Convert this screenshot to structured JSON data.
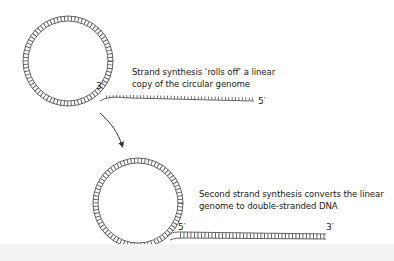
{
  "diagram": {
    "stage1": {
      "caption_lines": [
        "Strand synthesis ‘rolls off’ a linear",
        "copy of the circular genome"
      ],
      "label_circle_end": "3′",
      "label_strand_end": "5′"
    },
    "stage2": {
      "caption_lines": [
        "Second strand synthesis converts the linear",
        "genome to double-stranded DNA"
      ],
      "label_circle_end": "5′",
      "label_strand_end": "3′"
    },
    "colors": {
      "strand": "#555555",
      "arrow": "#333333",
      "text": "#1a1a1a",
      "footer": "#f3f3f3"
    }
  }
}
